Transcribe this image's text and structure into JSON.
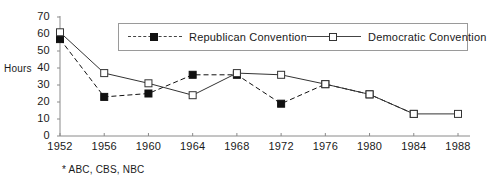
{
  "chart_data": {
    "type": "line",
    "title": "",
    "xlabel": "",
    "ylabel": "Hours",
    "x": [
      1952,
      1956,
      1960,
      1964,
      1968,
      1972,
      1976,
      1980,
      1984,
      1988
    ],
    "categories": [
      "1952",
      "1956",
      "1960",
      "1964",
      "1968",
      "1972",
      "1976",
      "1980",
      "1984",
      "1988"
    ],
    "ylim": [
      0,
      70
    ],
    "yticks": [
      0,
      10,
      20,
      30,
      40,
      50,
      60,
      70
    ],
    "ytick_labels": [
      "0",
      "10",
      "20",
      "30",
      "40",
      "50",
      "60",
      "70"
    ],
    "grid": false,
    "legend_position": "top-center",
    "series": [
      {
        "name": "Republican  Convention",
        "marker": "filled-square",
        "line_style": "dashed",
        "color": "#111111",
        "values": [
          57,
          23,
          25,
          36,
          36,
          19,
          30.5,
          24.5,
          13,
          null
        ]
      },
      {
        "name": "Democratic  Convention",
        "marker": "open-square",
        "line_style": "solid",
        "color": "#333333",
        "values": [
          61,
          37,
          31,
          24,
          37,
          36,
          30.5,
          24.5,
          13,
          13
        ]
      }
    ],
    "annotations": [
      "* ABC, CBS, NBC"
    ]
  },
  "axis": {
    "y_title": "Hours"
  },
  "footnote": {
    "text": "* ABC, CBS, NBC"
  },
  "legend": {
    "items": [
      {
        "label": "Republican  Convention"
      },
      {
        "label": "Democratic  Convention"
      }
    ]
  }
}
